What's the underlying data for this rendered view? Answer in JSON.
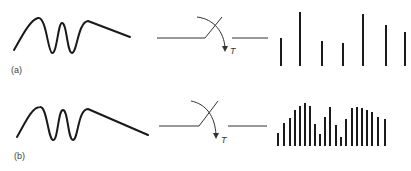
{
  "panels": [
    {
      "label": "(a)",
      "switch_label": "T",
      "description": "Sparse sampling",
      "samples": {
        "baseline": 66,
        "x": [
          281,
          300,
          322,
          343,
          363,
          386,
          405
        ],
        "tops": [
          38,
          12,
          41,
          43,
          14,
          25,
          32
        ]
      }
    },
    {
      "label": "(b)",
      "switch_label": "T",
      "description": "Dense sampling",
      "samples": {
        "baseline": 146,
        "x": [
          278,
          284,
          290,
          295,
          300,
          305,
          310,
          315,
          320,
          325,
          330,
          336,
          341,
          346,
          352,
          357,
          362,
          367,
          372,
          378,
          385
        ],
        "tops": [
          133,
          123,
          118,
          110,
          106,
          103,
          106,
          124,
          134,
          117,
          107,
          125,
          137,
          119,
          108,
          107,
          108,
          110,
          112,
          117,
          119
        ]
      }
    }
  ],
  "colors": {
    "stroke": "#1a1a1a",
    "label": "#444444"
  }
}
